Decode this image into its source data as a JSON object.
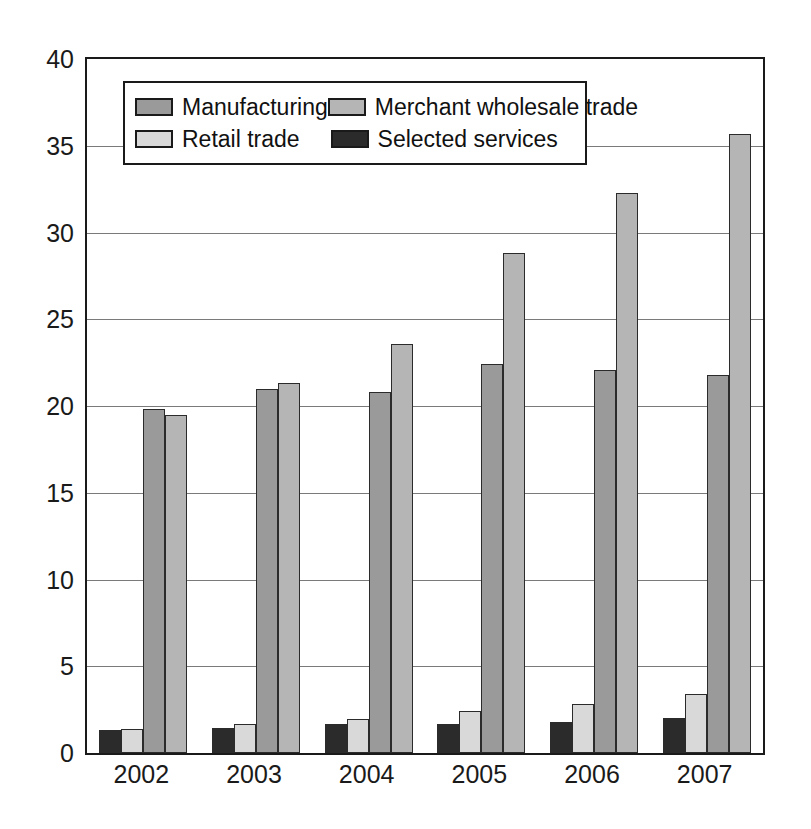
{
  "chart_data": {
    "type": "bar",
    "title": "",
    "xlabel": "",
    "ylabel": "",
    "ylim": [
      0,
      40
    ],
    "ytick_step": 5,
    "yticks": [
      0,
      5,
      10,
      15,
      20,
      25,
      30,
      35,
      40
    ],
    "ytick_labels": [
      "0",
      "5",
      "10",
      "15",
      "20",
      "25",
      "30",
      "35",
      "40"
    ],
    "grid": true,
    "grid_axis": "y",
    "legend_position": "upper-left-inside",
    "categories": [
      "2002",
      "2003",
      "2004",
      "2005",
      "2006",
      "2007"
    ],
    "bar_draw_order": [
      "Selected services",
      "Retail trade",
      "Manufacturing",
      "Merchant wholesale trade"
    ],
    "series": [
      {
        "name": "Manufacturing",
        "color": "#9a9a9a",
        "values": [
          19.8,
          21.0,
          20.8,
          22.4,
          22.1,
          21.8
        ]
      },
      {
        "name": "Merchant wholesale trade",
        "color": "#b5b5b5",
        "values": [
          19.5,
          21.3,
          23.6,
          28.8,
          32.3,
          35.7
        ]
      },
      {
        "name": "Retail trade",
        "color": "#d9d9d9",
        "values": [
          1.4,
          1.7,
          1.95,
          2.4,
          2.8,
          3.4
        ]
      },
      {
        "name": "Selected services",
        "color": "#2b2b2b",
        "values": [
          1.3,
          1.45,
          1.7,
          1.7,
          1.8,
          2.0
        ]
      }
    ]
  },
  "legend": {
    "items": [
      {
        "label": "Manufacturing",
        "color": "#9a9a9a"
      },
      {
        "label": "Merchant wholesale trade",
        "color": "#b5b5b5"
      },
      {
        "label": "Retail trade",
        "color": "#d9d9d9"
      },
      {
        "label": "Selected services",
        "color": "#2b2b2b"
      }
    ]
  },
  "axes": {
    "y_labels": [
      "40",
      "35",
      "30",
      "25",
      "20",
      "15",
      "10",
      "5",
      "0"
    ],
    "x_labels": [
      "2002",
      "2003",
      "2004",
      "2005",
      "2006",
      "2007"
    ]
  }
}
